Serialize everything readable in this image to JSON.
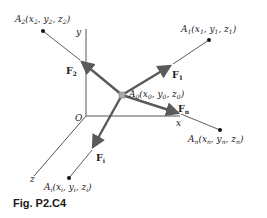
{
  "figure": {
    "caption": "Fig. P2.C4",
    "axes": {
      "x": "x",
      "y": "y",
      "z": "z",
      "origin": "O"
    },
    "center_point": {
      "name": "A",
      "sub": "0",
      "coords": "(x0, y0, z0)"
    },
    "points": [
      {
        "id": "A1",
        "label": "A1(x1, y1, z1)"
      },
      {
        "id": "A2",
        "label": "A2(x2, y2, z2)"
      },
      {
        "id": "An",
        "label": "An(xn, yn, zn)"
      },
      {
        "id": "Ai",
        "label": "Ai(xi, yi, zi)"
      }
    ],
    "forces": [
      {
        "id": "F1",
        "label": "F1"
      },
      {
        "id": "F2",
        "label": "F2"
      },
      {
        "id": "Fn",
        "label": "Fn"
      },
      {
        "id": "Fi",
        "label": "Fi"
      }
    ],
    "colors": {
      "force_arrow": "#5a5a5a",
      "axis": "#555555",
      "line": "#333333",
      "point": "#111111"
    }
  }
}
